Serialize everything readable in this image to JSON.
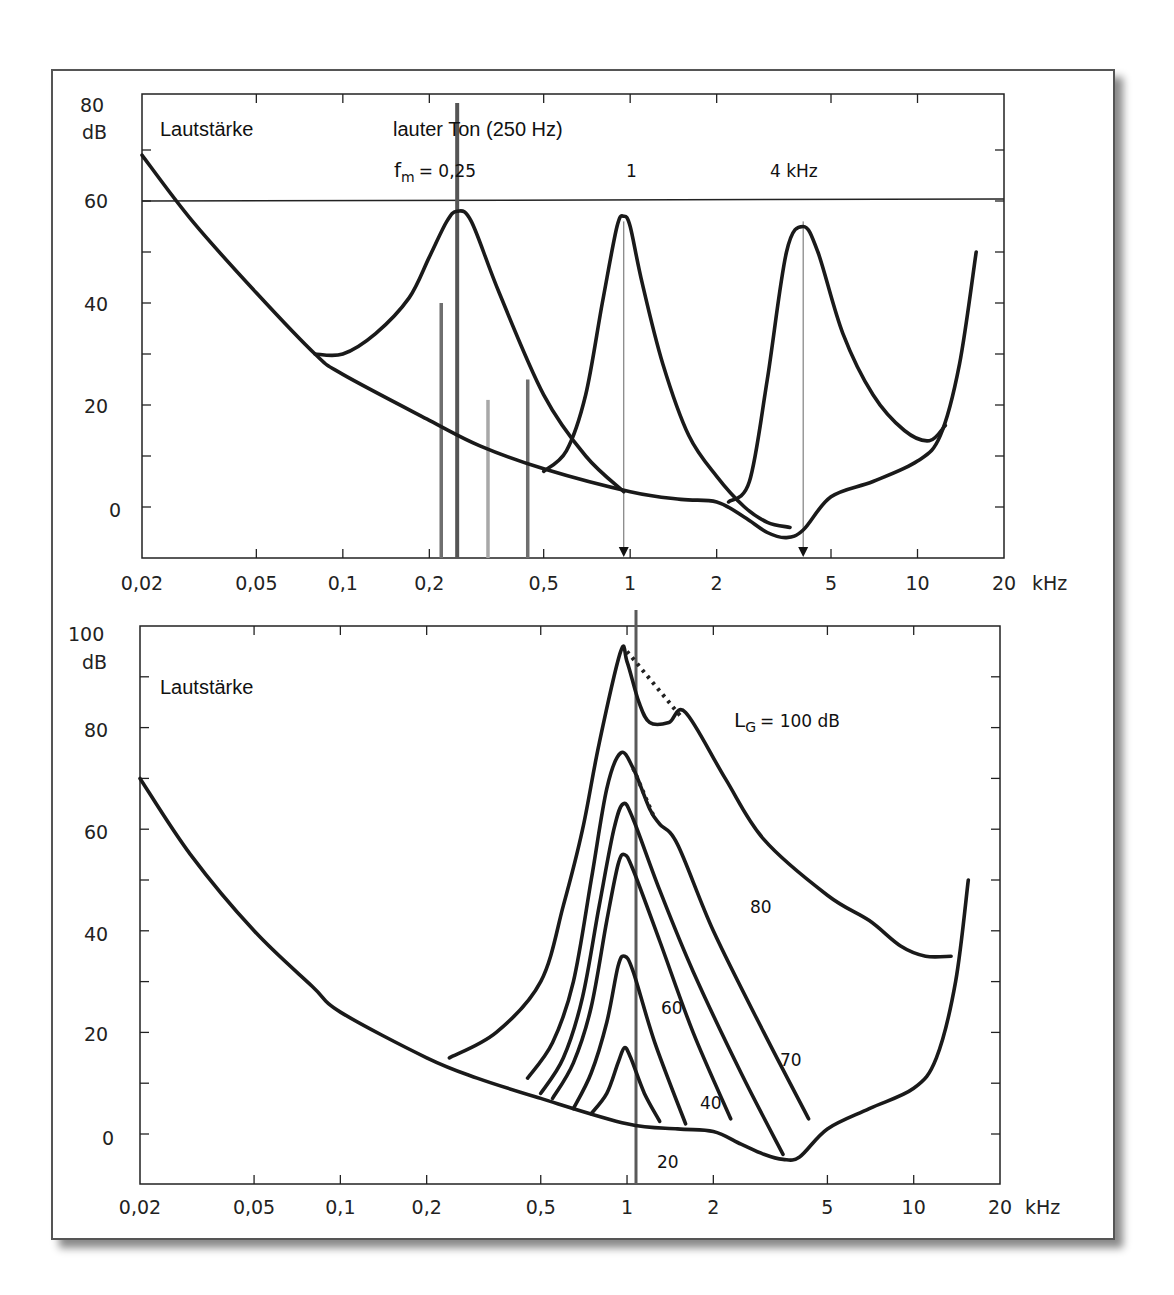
{
  "figure": {
    "upper_panel": {
      "y_unit_label": "dB",
      "y_top_label": "80",
      "y_tick_labels": [
        "60",
        "40",
        "20",
        "0"
      ],
      "x_tick_labels": [
        "0,02",
        "0,05",
        "0,1",
        "0,2",
        "0,5",
        "1",
        "2",
        "5",
        "10",
        "20"
      ],
      "x_unit_label": "kHz",
      "title_label": "Lautstärke",
      "loud_tone_label": "lauter Ton (250 Hz)",
      "fm_label_prefix": "f",
      "fm_label_sub": "m",
      "fm_label_value": "= 0,25",
      "fm_label_1": "1",
      "fm_label_4": "4 kHz"
    },
    "lower_panel": {
      "y_unit_label": "dB",
      "y_top_label": "100",
      "y_tick_labels": [
        "80",
        "60",
        "40",
        "20",
        "0"
      ],
      "x_tick_labels": [
        "0,02",
        "0,05",
        "0,1",
        "0,2",
        "0,5",
        "1",
        "2",
        "5",
        "10",
        "20"
      ],
      "x_unit_label": "kHz",
      "title_label": "Lautstärke",
      "lg_label_prefix": "L",
      "lg_label_sub": "G",
      "lg_label_value": "= 100 dB",
      "curve_labels": [
        "80",
        "70",
        "60",
        "40",
        "20"
      ]
    }
  },
  "chart_data": [
    {
      "type": "line",
      "title": "Mithörschwellen von Schmalbandrauschen (f_m = 0,25 / 1 / 4 kHz) und lauter Ton (250 Hz)",
      "xlabel": "kHz",
      "ylabel": "dB",
      "xscale": "log",
      "xlim": [
        0.02,
        20
      ],
      "ylim": [
        -10,
        80
      ],
      "x_ticks": [
        0.02,
        0.05,
        0.1,
        0.2,
        0.5,
        1,
        2,
        5,
        10,
        20
      ],
      "y_ticks": [
        0,
        20,
        40,
        60,
        80
      ],
      "grid": false,
      "reference_line_db": 60,
      "annotations": [
        "Lautstärke",
        "lauter Ton (250 Hz)",
        "f_m = 0,25",
        "1",
        "4 kHz"
      ],
      "series": [
        {
          "name": "Ruhehörschwelle",
          "x": [
            0.02,
            0.03,
            0.05,
            0.08,
            0.1,
            0.2,
            0.3,
            0.5,
            1,
            1.5,
            2,
            2.5,
            3,
            3.5,
            4,
            5,
            7,
            10,
            12,
            14,
            16
          ],
          "y": [
            69,
            56,
            42,
            30,
            26,
            17,
            12,
            7.5,
            3,
            1.5,
            1,
            -2,
            -5,
            -6,
            -4.5,
            2,
            5,
            9,
            14,
            28,
            50
          ]
        },
        {
          "name": "Mithörschwelle f_m=0,25 kHz",
          "x": [
            0.08,
            0.1,
            0.13,
            0.17,
            0.2,
            0.23,
            0.25,
            0.28,
            0.35,
            0.5,
            0.7,
            0.95
          ],
          "y": [
            30,
            30,
            34,
            41,
            49,
            56,
            58,
            56,
            42,
            22,
            10,
            3
          ]
        },
        {
          "name": "Mithörschwelle f_m=1 kHz",
          "x": [
            0.5,
            0.6,
            0.7,
            0.8,
            0.9,
            0.95,
            1.0,
            1.1,
            1.3,
            1.6,
            2.0,
            2.5,
            3.0,
            3.6
          ],
          "y": [
            7,
            11,
            22,
            40,
            55,
            57,
            55,
            44,
            28,
            14,
            6,
            0,
            -3,
            -4
          ]
        },
        {
          "name": "Mithörschwelle f_m=4 kHz",
          "x": [
            2.2,
            2.6,
            3.0,
            3.5,
            4.0,
            4.5,
            5.5,
            7,
            9,
            11,
            12.5
          ],
          "y": [
            1,
            5,
            25,
            50,
            55,
            50,
            34,
            22,
            15,
            13,
            16
          ]
        }
      ],
      "bars_db": [
        {
          "x": 0.22,
          "y": 40,
          "shade": "#6f6f6f"
        },
        {
          "x": 0.25,
          "y": 80,
          "shade": "#555555"
        },
        {
          "x": 0.32,
          "y": 21,
          "shade": "#a8a8a8"
        },
        {
          "x": 0.44,
          "y": 25,
          "shade": "#6f6f6f"
        }
      ],
      "arrows_khz": [
        0.95,
        4.0
      ]
    },
    {
      "type": "line",
      "title": "Mithörschwellen von 1-kHz-Schmalbandrauschen für verschiedene Pegel L_G",
      "xlabel": "kHz",
      "ylabel": "dB",
      "xscale": "log",
      "xlim": [
        0.02,
        20
      ],
      "ylim": [
        -10,
        100
      ],
      "x_ticks": [
        0.02,
        0.05,
        0.1,
        0.2,
        0.5,
        1,
        2,
        5,
        10,
        20
      ],
      "y_ticks": [
        0,
        20,
        40,
        60,
        80,
        100
      ],
      "grid": false,
      "marker_line_khz": 1,
      "annotations": [
        "Lautstärke",
        "L_G = 100 dB",
        "80",
        "70",
        "60",
        "40",
        "20"
      ],
      "series": [
        {
          "name": "Ruhehörschwelle",
          "x": [
            0.02,
            0.03,
            0.05,
            0.08,
            0.1,
            0.2,
            0.3,
            0.5,
            1,
            1.5,
            2,
            2.5,
            3,
            3.5,
            4,
            5,
            7,
            10,
            12,
            14,
            15.5
          ],
          "y": [
            70,
            55,
            40,
            29,
            24,
            15,
            11,
            7,
            2,
            1,
            0.5,
            -2,
            -4,
            -5,
            -4.5,
            1,
            5,
            9,
            15,
            30,
            50
          ]
        },
        {
          "name": "L_G = 100 dB",
          "x": [
            0.24,
            0.35,
            0.5,
            0.6,
            0.7,
            0.8,
            0.95,
            1.0,
            1.1,
            1.2,
            1.4,
            1.6,
            2.2,
            3,
            5,
            7,
            9,
            11,
            13.5
          ],
          "y": [
            15,
            20,
            30,
            45,
            60,
            77,
            95,
            93,
            85,
            81,
            81,
            83,
            70,
            58,
            47,
            42,
            37,
            35,
            35
          ]
        },
        {
          "name": "L_G = 80 dB",
          "x": [
            0.45,
            0.55,
            0.65,
            0.75,
            0.85,
            0.95,
            1.05,
            1.2,
            1.3,
            1.5,
            2,
            3,
            4.3
          ],
          "y": [
            11,
            18,
            30,
            50,
            68,
            75,
            72,
            64,
            61,
            57,
            40,
            20,
            3
          ]
        },
        {
          "name": "L_G = 70 dB",
          "x": [
            0.5,
            0.6,
            0.7,
            0.8,
            0.9,
            0.97,
            1.05,
            1.3,
            1.7,
            2.5,
            3.5
          ],
          "y": [
            8,
            15,
            27,
            45,
            60,
            65,
            62,
            48,
            32,
            12,
            -4
          ]
        },
        {
          "name": "L_G = 60 dB",
          "x": [
            0.55,
            0.65,
            0.75,
            0.85,
            0.93,
            0.98,
            1.05,
            1.3,
            1.7,
            2.3
          ],
          "y": [
            7,
            14,
            25,
            42,
            53,
            55,
            52,
            38,
            20,
            3
          ]
        },
        {
          "name": "L_G = 40 dB",
          "x": [
            0.65,
            0.75,
            0.85,
            0.93,
            0.98,
            1.05,
            1.25,
            1.6
          ],
          "y": [
            5,
            12,
            22,
            33,
            35,
            32,
            18,
            2
          ]
        },
        {
          "name": "L_G = 20 dB",
          "x": [
            0.75,
            0.85,
            0.93,
            0.98,
            1.03,
            1.15,
            1.3
          ],
          "y": [
            4,
            8,
            14,
            17,
            15,
            8,
            2.5
          ]
        }
      ],
      "dotted_segments": [
        {
          "x": [
            1.0,
            1.55
          ],
          "y": [
            95,
            82
          ]
        },
        {
          "x": [
            1.05,
            1.25
          ],
          "y": [
            72,
            62
          ]
        }
      ]
    }
  ],
  "style": {
    "line_color": "#1a1a1a",
    "marker_line_color": "#5a5a5a",
    "frame_color": "#555555",
    "shadow_color": "#8a8a8a"
  }
}
